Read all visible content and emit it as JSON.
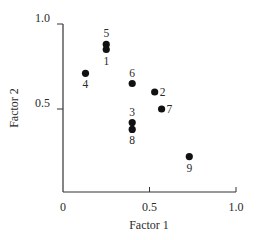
{
  "chart_data": {
    "type": "scatter",
    "title": "",
    "xlabel": "Factor 1",
    "ylabel": "Factor 2",
    "xlim": [
      0,
      1.0
    ],
    "ylim": [
      0,
      1.0
    ],
    "xticks": [
      {
        "value": 0,
        "label": "0"
      },
      {
        "value": 0.5,
        "label": "0.5"
      },
      {
        "value": 1.0,
        "label": "1.0"
      }
    ],
    "yticks": [
      {
        "value": 0.5,
        "label": "0.5"
      },
      {
        "value": 1.0,
        "label": "1.0"
      }
    ],
    "grid": false,
    "legend": null,
    "points": [
      {
        "label": "1",
        "x": 0.25,
        "y": 0.85,
        "label_pos": "below"
      },
      {
        "label": "2",
        "x": 0.53,
        "y": 0.6,
        "label_pos": "right"
      },
      {
        "label": "3",
        "x": 0.4,
        "y": 0.42,
        "label_pos": "above"
      },
      {
        "label": "4",
        "x": 0.13,
        "y": 0.71,
        "label_pos": "below"
      },
      {
        "label": "5",
        "x": 0.25,
        "y": 0.88,
        "label_pos": "above"
      },
      {
        "label": "6",
        "x": 0.4,
        "y": 0.65,
        "label_pos": "above"
      },
      {
        "label": "7",
        "x": 0.57,
        "y": 0.5,
        "label_pos": "right"
      },
      {
        "label": "8",
        "x": 0.4,
        "y": 0.38,
        "label_pos": "below"
      },
      {
        "label": "9",
        "x": 0.73,
        "y": 0.22,
        "label_pos": "below"
      }
    ]
  },
  "colors": {
    "point": "#111111",
    "axis": "#333333",
    "text": "#2a2a2a"
  }
}
